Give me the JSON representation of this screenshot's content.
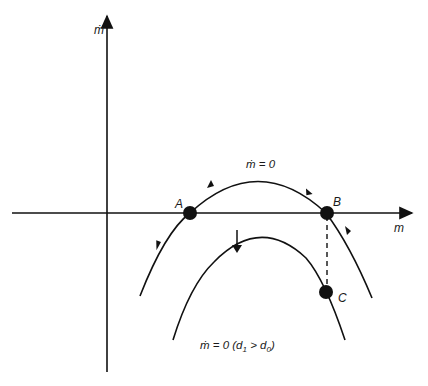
{
  "diagram": {
    "axes": {
      "y_label": "ṁ",
      "x_label": "m"
    },
    "curves": {
      "upper": {
        "label": "ṁ = 0"
      },
      "lower": {
        "label_main": "ṁ = 0 (d",
        "sub1": "1",
        "gt": " > d",
        "sub0": "0",
        "close": ")"
      }
    },
    "points": [
      {
        "id": "A",
        "label": "A"
      },
      {
        "id": "B",
        "label": "B"
      },
      {
        "id": "C",
        "label": "C"
      }
    ],
    "colors": {
      "stroke": "#111111",
      "background": "#ffffff"
    }
  }
}
